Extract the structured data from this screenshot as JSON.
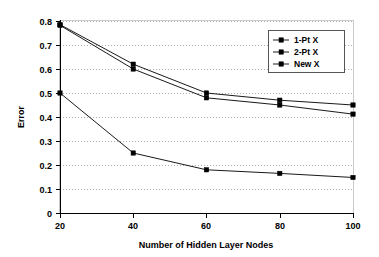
{
  "chart_data": {
    "type": "line",
    "title": "",
    "xlabel": "Number of Hidden Layer Nodes",
    "ylabel": "Error",
    "x": [
      20,
      40,
      60,
      80,
      100
    ],
    "xticklabels": [
      "20",
      "40",
      "60",
      "80",
      "100"
    ],
    "yticklabels": [
      "0",
      "0.1",
      "0.2",
      "0.3",
      "0.4",
      "0.5",
      "0.6",
      "0.7",
      "0.8"
    ],
    "xlim": [
      20,
      100
    ],
    "ylim": [
      0,
      0.8
    ],
    "grid": "horizontal-dotted",
    "legend_position": "top-right-inside",
    "series": [
      {
        "name": "1-Pt X",
        "marker": "square",
        "values": [
          0.785,
          0.62,
          0.5,
          0.47,
          0.45
        ]
      },
      {
        "name": "2-Pt X",
        "marker": "square",
        "values": [
          0.782,
          0.6,
          0.48,
          0.45,
          0.412
        ]
      },
      {
        "name": "New X",
        "marker": "square",
        "values": [
          0.5,
          0.25,
          0.18,
          0.165,
          0.148
        ]
      }
    ]
  },
  "axes": {
    "y_title": "Error",
    "x_title": "Number of Hidden Layer Nodes",
    "y_ticks": [
      {
        "label": "0.8"
      },
      {
        "label": "0.7"
      },
      {
        "label": "0.6"
      },
      {
        "label": "0.5"
      },
      {
        "label": "0.4"
      },
      {
        "label": "0.3"
      },
      {
        "label": "0.2"
      },
      {
        "label": "0.1"
      },
      {
        "label": "0"
      }
    ],
    "x_ticks": [
      {
        "label": "20"
      },
      {
        "label": "40"
      },
      {
        "label": "60"
      },
      {
        "label": "80"
      },
      {
        "label": "100"
      }
    ]
  },
  "legend": {
    "entries": [
      {
        "label": "1-Pt X"
      },
      {
        "label": "2-Pt X"
      },
      {
        "label": "New X"
      }
    ]
  }
}
